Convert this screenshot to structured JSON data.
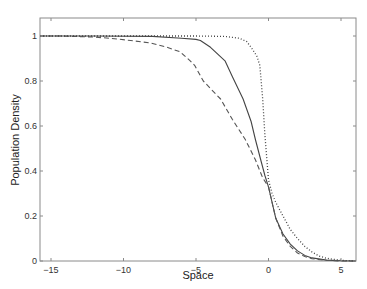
{
  "chart_data": {
    "type": "line",
    "title": "",
    "xlabel": "Space",
    "ylabel": "Population Density",
    "xlim": [
      -16,
      6
    ],
    "ylim": [
      0,
      1.08
    ],
    "xticks": [
      -15,
      -10,
      -5,
      0,
      5
    ],
    "xtick_labels": [
      "−15",
      "−10",
      "−5",
      "0",
      "5"
    ],
    "yticks": [
      0,
      0.2,
      0.4,
      0.6,
      0.8,
      1
    ],
    "ytick_labels": [
      "0",
      "0.2",
      "0.4",
      "0.6",
      "0.8",
      "1"
    ],
    "grid": false,
    "legend": null,
    "series": [
      {
        "name": "solid",
        "style": "solid",
        "color": "#444444",
        "x": [
          -16,
          -12,
          -8,
          -6,
          -5,
          -4.7,
          -4,
          -3,
          -2.5,
          -1.75,
          -1.2,
          -0.9,
          -0.5,
          -0.25,
          0,
          0.25,
          0.5,
          1,
          1.5,
          2,
          2.5,
          3,
          4,
          5,
          6
        ],
        "y": [
          1.0,
          1.0,
          0.998,
          0.99,
          0.985,
          0.98,
          0.95,
          0.89,
          0.82,
          0.72,
          0.62,
          0.54,
          0.44,
          0.38,
          0.33,
          0.26,
          0.19,
          0.12,
          0.075,
          0.045,
          0.025,
          0.014,
          0.004,
          0.001,
          0.0
        ]
      },
      {
        "name": "dashed",
        "style": "dashed",
        "color": "#555555",
        "x": [
          -16,
          -14.4,
          -12,
          -10.9,
          -9.5,
          -8.2,
          -7,
          -6.1,
          -5.4,
          -5.1,
          -4.5,
          -3.9,
          -3.3,
          -2.5,
          -1.6,
          -0.9,
          -0.4,
          0,
          0.25,
          0.5,
          1,
          1.5,
          2,
          2.5,
          3,
          4,
          5,
          6
        ],
        "y": [
          1.0,
          1.0,
          0.995,
          0.99,
          0.98,
          0.97,
          0.95,
          0.93,
          0.89,
          0.87,
          0.8,
          0.76,
          0.72,
          0.63,
          0.54,
          0.45,
          0.37,
          0.33,
          0.26,
          0.19,
          0.11,
          0.065,
          0.035,
          0.02,
          0.01,
          0.003,
          0.0,
          0.0
        ]
      },
      {
        "name": "dotted",
        "style": "dotted",
        "color": "#444444",
        "x": [
          -16,
          -10,
          -5,
          -3,
          -2,
          -1.5,
          -1.1,
          -0.8,
          -0.6,
          -0.4,
          -0.25,
          0,
          0.25,
          0.5,
          1,
          1.5,
          2,
          2.5,
          3,
          3.5,
          4,
          5,
          6
        ],
        "y": [
          1.0,
          1.0,
          1.0,
          0.998,
          0.99,
          0.975,
          0.94,
          0.91,
          0.87,
          0.72,
          0.56,
          0.36,
          0.3,
          0.26,
          0.2,
          0.14,
          0.1,
          0.065,
          0.04,
          0.022,
          0.012,
          0.003,
          0.0
        ]
      }
    ]
  }
}
